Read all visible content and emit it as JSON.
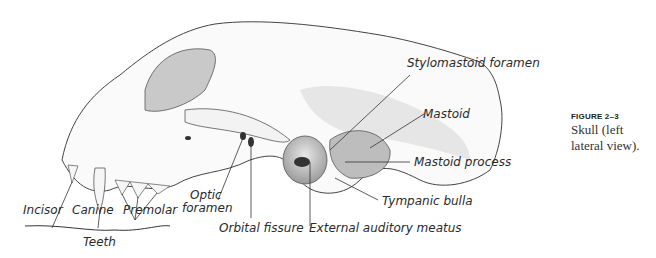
{
  "figure": {
    "number": "FIGURE 2–3",
    "caption": "Skull (left lateral view)."
  },
  "labels": {
    "stylomastoid_foramen": "Stylomastoid foramen",
    "mastoid": "Mastoid",
    "mastoid_process": "Mastoid process",
    "tympanic_bulla": "Tympanic bulla",
    "external_auditory_meatus": "External auditory meatus",
    "orbital_fissure": "Orbital fissure",
    "optic_foramen_line1": "Optic",
    "optic_foramen_line2": "foramen",
    "incisor": "Incisor",
    "canine": "Canine",
    "premolar": "Premolar",
    "teeth": "Teeth"
  }
}
